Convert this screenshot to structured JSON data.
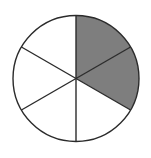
{
  "figure": {
    "name": "fraction-circle-diagram",
    "title": "",
    "caption": "",
    "background_color": "#ffffff"
  },
  "chart_data": {
    "type": "pie",
    "title": "",
    "subtitle": "",
    "xlabel": "",
    "ylabel": "",
    "legend": [],
    "legend_position": "none",
    "grid": false,
    "total_slices": 6,
    "shaded_slices": 2,
    "unshaded_slices": 4,
    "fraction_shaded": "2/6",
    "fraction_simplified": "1/3",
    "slice_angle_degrees": 60,
    "start_angle_degrees": 0,
    "categories": [
      "sector-1",
      "sector-2",
      "sector-3",
      "sector-4",
      "sector-5",
      "sector-6"
    ],
    "values": [
      1,
      1,
      1,
      1,
      1,
      1
    ],
    "slice_states": [
      "shaded",
      "shaded",
      "unshaded",
      "unshaded",
      "unshaded",
      "unshaded"
    ],
    "series": [
      {
        "name": "equal-sectors",
        "values": [
          1,
          1,
          1,
          1,
          1,
          1
        ]
      }
    ]
  },
  "geometry": {
    "center_x": 76,
    "center_y": 78.5,
    "radius": 63,
    "stroke_width": 1.4,
    "divider_stroke_width": 1.4
  },
  "colors": {
    "shaded_fill": "#7e7e7e",
    "unshaded_fill": "#ffffff",
    "outline": "#2b2b2b",
    "divider": "#2b2b2b",
    "background": "#ffffff"
  },
  "slices": [
    {
      "label": "sector-1",
      "start_deg": 0,
      "end_deg": 60,
      "state": "shaded",
      "fill": "#7e7e7e"
    },
    {
      "label": "sector-2",
      "start_deg": 60,
      "end_deg": 120,
      "state": "shaded",
      "fill": "#7e7e7e"
    },
    {
      "label": "sector-3",
      "start_deg": 120,
      "end_deg": 180,
      "state": "unshaded",
      "fill": "#ffffff"
    },
    {
      "label": "sector-4",
      "start_deg": 180,
      "end_deg": 240,
      "state": "unshaded",
      "fill": "#ffffff"
    },
    {
      "label": "sector-5",
      "start_deg": 240,
      "end_deg": 300,
      "state": "unshaded",
      "fill": "#ffffff"
    },
    {
      "label": "sector-6",
      "start_deg": 300,
      "end_deg": 360,
      "state": "unshaded",
      "fill": "#ffffff"
    }
  ]
}
